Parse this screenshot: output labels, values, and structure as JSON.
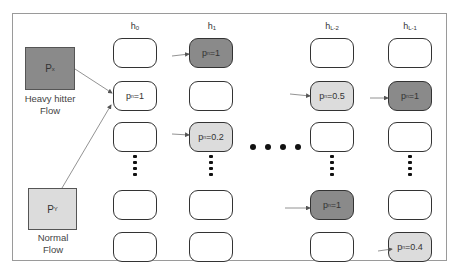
{
  "diagram": {
    "columns": [
      {
        "id": "h0",
        "label_main": "h",
        "label_sub": "0"
      },
      {
        "id": "h1",
        "label_main": "h",
        "label_sub": "1"
      },
      {
        "id": "hL-2",
        "label_main": "h",
        "label_sub": "L-2"
      },
      {
        "id": "hL-1",
        "label_main": "h",
        "label_sub": "L-1"
      }
    ],
    "flows": {
      "heavy": {
        "box_main": "P",
        "box_sub": "x",
        "label_line1": "Heavy hitter",
        "label_line2": "Flow",
        "color": "#8a8a8a"
      },
      "normal": {
        "box_main": "P",
        "box_sub": "Y",
        "label_line1": "Normal",
        "label_line2": "Flow",
        "color": "#dcdcdc"
      }
    },
    "cells": [
      {
        "col": "h0",
        "row": 0,
        "label_main": "",
        "label_sub": "",
        "value": "",
        "fill": "white"
      },
      {
        "col": "h0",
        "row": 1,
        "label_main": "p",
        "label_sub": "n",
        "value": "=1",
        "fill": "white",
        "arrow_in_from": "both flows"
      },
      {
        "col": "h0",
        "row": 2,
        "label_main": "",
        "label_sub": "",
        "value": "",
        "fill": "white"
      },
      {
        "col": "h0",
        "row": 3,
        "label_main": "",
        "label_sub": "",
        "value": "",
        "fill": "white"
      },
      {
        "col": "h0",
        "row": 4,
        "label_main": "",
        "label_sub": "",
        "value": "",
        "fill": "white"
      },
      {
        "col": "h1",
        "row": 0,
        "label_main": "p",
        "label_sub": "n",
        "value": "=1",
        "fill": "dark",
        "arrow_in": true
      },
      {
        "col": "h1",
        "row": 1,
        "label_main": "",
        "label_sub": "",
        "value": "",
        "fill": "white"
      },
      {
        "col": "h1",
        "row": 2,
        "label_main": "p",
        "label_sub": "n",
        "value": "=0.2",
        "fill": "light",
        "arrow_in": true
      },
      {
        "col": "h1",
        "row": 3,
        "label_main": "",
        "label_sub": "",
        "value": "",
        "fill": "white"
      },
      {
        "col": "h1",
        "row": 4,
        "label_main": "",
        "label_sub": "",
        "value": "",
        "fill": "white"
      },
      {
        "col": "hL-2",
        "row": 0,
        "label_main": "",
        "label_sub": "",
        "value": "",
        "fill": "white"
      },
      {
        "col": "hL-2",
        "row": 1,
        "label_main": "p",
        "label_sub": "n",
        "value": "=0.5",
        "fill": "light",
        "arrow_in": true
      },
      {
        "col": "hL-2",
        "row": 2,
        "label_main": "",
        "label_sub": "",
        "value": "",
        "fill": "white"
      },
      {
        "col": "hL-2",
        "row": 3,
        "label_main": "p",
        "label_sub": "n",
        "value": "=1",
        "fill": "dark",
        "arrow_in": true
      },
      {
        "col": "hL-2",
        "row": 4,
        "label_main": "",
        "label_sub": "",
        "value": "",
        "fill": "white"
      },
      {
        "col": "hL-1",
        "row": 0,
        "label_main": "",
        "label_sub": "",
        "value": "",
        "fill": "white"
      },
      {
        "col": "hL-1",
        "row": 1,
        "label_main": "p",
        "label_sub": "n",
        "value": "=1",
        "fill": "dark",
        "arrow_in": true
      },
      {
        "col": "hL-1",
        "row": 2,
        "label_main": "",
        "label_sub": "",
        "value": "",
        "fill": "white"
      },
      {
        "col": "hL-1",
        "row": 3,
        "label_main": "",
        "label_sub": "",
        "value": "",
        "fill": "white"
      },
      {
        "col": "hL-1",
        "row": 4,
        "label_main": "p",
        "label_sub": "n",
        "value": "=0.4",
        "fill": "light",
        "arrow_in": true
      }
    ],
    "ellipsis": {
      "horizontal": "• • • •",
      "vertical": "⋮"
    },
    "colors": {
      "dark_fill": "#8a8a8a",
      "light_fill": "#dcdcdc",
      "border": "#333333",
      "arrow": "#666666",
      "frame": "#9a9a9a"
    }
  }
}
